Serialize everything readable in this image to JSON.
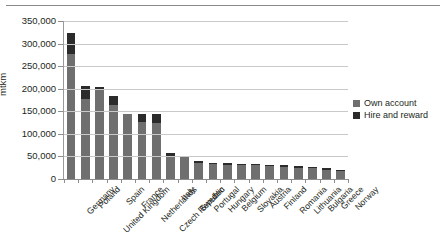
{
  "chart_data": {
    "type": "bar",
    "subtype": "stacked",
    "title": "",
    "xlabel": "",
    "ylabel": "mtkm",
    "ylim": [
      0,
      350000
    ],
    "ytick_values": [
      0,
      50000,
      100000,
      150000,
      200000,
      250000,
      300000,
      350000
    ],
    "ytick_labels": [
      "0",
      "50,000",
      "100,000",
      "150,000",
      "200,000",
      "250,000",
      "300,000",
      "350,000"
    ],
    "grid": true,
    "legend_position": "right",
    "categories": [
      "Germany",
      "Poland",
      "United Kingdom",
      "Spain",
      "France",
      "Netherlands",
      "Czech Republic",
      "Italy",
      "Sweden",
      "Portugal",
      "Hungary",
      "Belgium",
      "Slovakia",
      "Austria",
      "Finland",
      "Romania",
      "Lithuania",
      "Bulgaria",
      "Greece",
      "Norway"
    ],
    "series": [
      {
        "name": "Own account",
        "color": "#6f6f6f",
        "values": [
          278000,
          178000,
          200000,
          163000,
          143000,
          126000,
          123000,
          52000,
          50000,
          36000,
          33000,
          32000,
          31000,
          30000,
          29000,
          27000,
          25000,
          24000,
          21000,
          18000
        ]
      },
      {
        "name": "Hire and reward",
        "color": "#2b2b2b",
        "values": [
          45000,
          27000,
          3000,
          21000,
          2000,
          17000,
          20000,
          5000,
          2000,
          3000,
          3000,
          3000,
          3000,
          3000,
          3000,
          3000,
          3000,
          3000,
          3000,
          3000
        ]
      }
    ],
    "totals": [
      323000,
      205000,
      203000,
      184000,
      145000,
      143000,
      143000,
      57000,
      52000,
      39000,
      36000,
      35000,
      34000,
      33000,
      32000,
      30000,
      28000,
      27000,
      24000,
      21000
    ]
  },
  "legend": {
    "items": [
      {
        "label": "Own account",
        "color": "#6f6f6f"
      },
      {
        "label": "Hire and reward",
        "color": "#2b2b2b"
      }
    ]
  },
  "axis": {
    "y_title": "mtkm"
  }
}
